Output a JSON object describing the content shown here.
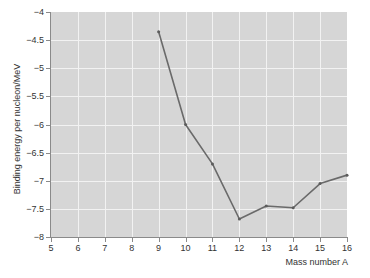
{
  "chart_data": {
    "type": "line",
    "title": "",
    "subtitle": "",
    "xlabel": "Mass number A",
    "ylabel": "Binding energy per nucleon/MeV",
    "xlim": [
      5,
      16
    ],
    "ylim": [
      -8,
      -4
    ],
    "grid": true,
    "legend": null,
    "xticks": [
      5,
      6,
      7,
      8,
      9,
      10,
      11,
      12,
      13,
      14,
      15,
      16
    ],
    "xticklabels": [
      "5",
      "6",
      "7",
      "8",
      "9",
      "10",
      "11",
      "12",
      "13",
      "14",
      "15",
      "16"
    ],
    "yticks": [
      -8,
      -7.5,
      -7,
      -6.5,
      -6,
      -5.5,
      -5,
      -4.5,
      -4
    ],
    "yticklabels": [
      "−8",
      "−7.5",
      "−7",
      "−6.5",
      "−6",
      "−5.5",
      "−5",
      "−4.5",
      "−4"
    ],
    "x": [
      9,
      10,
      11,
      12,
      13,
      14,
      15,
      16
    ],
    "values": [
      -4.35,
      -6.0,
      -6.7,
      -7.68,
      -7.45,
      -7.48,
      -7.05,
      -6.9
    ],
    "series": [
      {
        "name": "binding energy per nucleon",
        "x": [
          9,
          10,
          11,
          12,
          13,
          14,
          15,
          16
        ],
        "values": [
          -4.35,
          -6.0,
          -6.7,
          -7.68,
          -7.45,
          -7.48,
          -7.05,
          -6.9
        ]
      }
    ],
    "colors": {
      "line": "#6a6a6a",
      "marker": "#5c5c5c",
      "plot_background": "#d6d6d6",
      "gridlines": "#f2f2f2",
      "axis": "#8a8a8a",
      "text": "#333333",
      "figure_background": "#ffffff"
    },
    "marker_style": "dot",
    "line_width": 1.6
  }
}
